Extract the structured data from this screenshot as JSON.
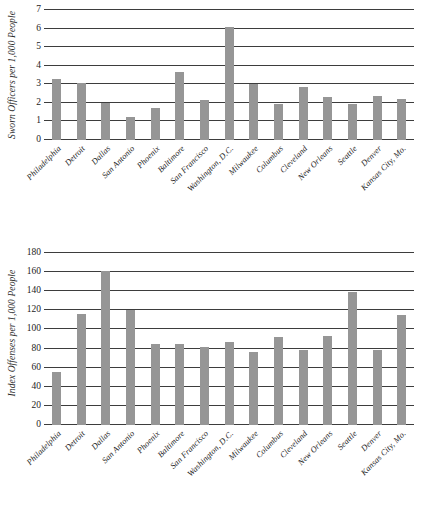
{
  "chart_data": [
    {
      "type": "bar",
      "title": "",
      "xlabel": "",
      "ylabel": "Sworn Officers per 1,000 People",
      "ylim": [
        0,
        7
      ],
      "ytick_step": 1,
      "yticks": [
        "0",
        "1",
        "2",
        "3",
        "4",
        "5",
        "6",
        "7"
      ],
      "grid": true,
      "legend": "none",
      "bar_color": "#969696",
      "categories": [
        "Philadelphia",
        "Detroit",
        "Dallas",
        "San Antonio",
        "Phoenix",
        "Baltimore",
        "San Francisco",
        "Washington, D.C.",
        "Milwaukee",
        "Columbus",
        "Cleveland",
        "New Orleans",
        "Seattle",
        "Denver",
        "Kansas City, Mo."
      ],
      "values": [
        3.3,
        3.05,
        2.0,
        1.25,
        1.75,
        3.65,
        2.15,
        6.1,
        3.0,
        1.95,
        2.85,
        2.3,
        1.95,
        2.35,
        2.2
      ]
    },
    {
      "type": "bar",
      "title": "",
      "xlabel": "",
      "ylabel": "Index Offenses per 1,000 People",
      "ylim": [
        0,
        180
      ],
      "ytick_step": 20,
      "yticks": [
        "0",
        "20",
        "40",
        "60",
        "80",
        "100",
        "120",
        "140",
        "160",
        "180"
      ],
      "grid": true,
      "legend": "none",
      "bar_color": "#969696",
      "categories": [
        "Philadelphia",
        "Detroit",
        "Dallas",
        "San Antonio",
        "Phoenix",
        "Baltimore",
        "San Francisco",
        "Washington, D.C.",
        "Milwaukee",
        "Columbus",
        "Cleveland",
        "New Orleans",
        "Seattle",
        "Denver",
        "Kansas City, Mo."
      ],
      "values": [
        55,
        116,
        161,
        120,
        85,
        85,
        82,
        87,
        76,
        92,
        78,
        93,
        139,
        78,
        115
      ]
    }
  ]
}
